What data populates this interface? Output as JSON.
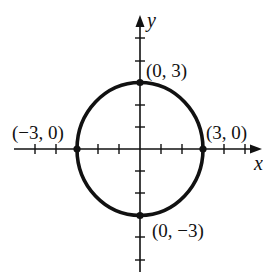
{
  "diagram": {
    "type": "circle-graph",
    "equation_implied": "x^2 + y^2 = 9",
    "axes": {
      "x_label": "x",
      "y_label": "y",
      "x_ticks": [
        -5,
        -4,
        -3,
        -2,
        -1,
        1,
        2,
        3,
        4,
        5
      ],
      "y_ticks": [
        5,
        4,
        3,
        2,
        1,
        -1,
        -2,
        -3,
        -4,
        -5
      ]
    },
    "circle": {
      "center": [
        0,
        0
      ],
      "radius": 3
    },
    "points": [
      {
        "label": "(0, 3)",
        "x": 0,
        "y": 3
      },
      {
        "label": "(−3, 0)",
        "x": -3,
        "y": 0
      },
      {
        "label": "(3, 0)",
        "x": 3,
        "y": 0
      },
      {
        "label": "(0, −3)",
        "x": 0,
        "y": -3
      }
    ],
    "colors": {
      "stroke": "#111111",
      "background": "#ffffff"
    }
  }
}
